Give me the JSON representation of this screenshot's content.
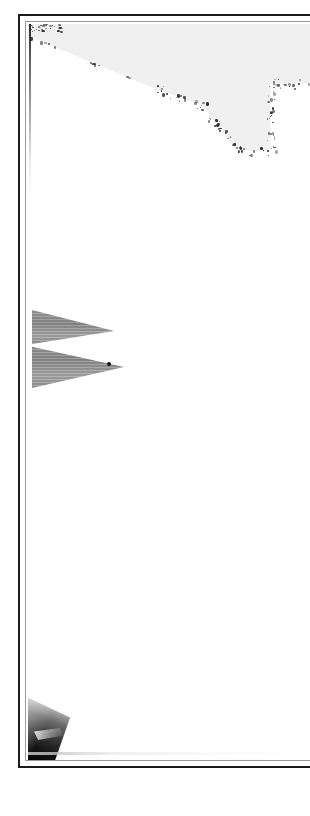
{
  "document": {
    "kind": "scanned-page",
    "title": "",
    "body_text": "",
    "page_number": "",
    "background_color": "#ffffff",
    "ink_color": "#1b1b1b"
  },
  "frame": {
    "outer_rule_color": "#1b1b1b",
    "inner_rule_color": "#9b9b9b",
    "note": ""
  },
  "artifacts": {
    "top_fragment": {
      "name": "top-grey-polygon",
      "fill_color": "#f0f0f0",
      "edge_color": "#2a2a2a",
      "label": ""
    },
    "scan_line": {
      "name": "left-vertical-scan-line",
      "color": "#1b1b1b",
      "label": ""
    },
    "wedges": [
      {
        "name": "upper-wedge",
        "fill_color": "#949494",
        "label": ""
      },
      {
        "name": "lower-wedge",
        "fill_color": "#949494",
        "label": ""
      }
    ],
    "bottom_fragment": {
      "name": "bottom-dark-triangle",
      "fill_color": "#121212",
      "highlight_color": "#ffffff",
      "label": ""
    },
    "bottom_smudge": {
      "name": "bottom-grey-smudge",
      "color": "#bebebe",
      "label": ""
    }
  }
}
